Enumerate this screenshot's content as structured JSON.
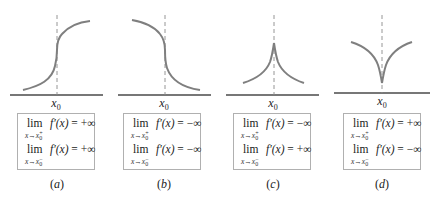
{
  "figure": {
    "colors": {
      "curve": "#7f7f7f",
      "dashed_line": "#8a8a8a",
      "axis": "#4a4a4a",
      "box_border": "#b0b0b0"
    },
    "panels": [
      {
        "id": "a",
        "caption_letter": "a",
        "x_label": "x",
        "x_label_sub": "0",
        "shape": "vertical tangent, increasing",
        "limits": [
          {
            "lim": "lim",
            "func": "f′(x)",
            "rel": "=",
            "value": "+∞",
            "var": "x",
            "arrow": "→",
            "target": "x",
            "target_sub": "0",
            "side": "+"
          },
          {
            "lim": "lim",
            "func": "f′(x)",
            "rel": "=",
            "value": "+∞",
            "var": "x",
            "arrow": "→",
            "target": "x",
            "target_sub": "0",
            "side": "−"
          }
        ]
      },
      {
        "id": "b",
        "caption_letter": "b",
        "x_label": "x",
        "x_label_sub": "0",
        "shape": "vertical tangent, decreasing",
        "limits": [
          {
            "lim": "lim",
            "func": "f′(x)",
            "rel": "=",
            "value": "−∞",
            "var": "x",
            "arrow": "→",
            "target": "x",
            "target_sub": "0",
            "side": "+"
          },
          {
            "lim": "lim",
            "func": "f′(x)",
            "rel": "=",
            "value": "−∞",
            "var": "x",
            "arrow": "→",
            "target": "x",
            "target_sub": "0",
            "side": "−"
          }
        ]
      },
      {
        "id": "c",
        "caption_letter": "c",
        "x_label": "x",
        "x_label_sub": "0",
        "shape": "cusp pointing up",
        "limits": [
          {
            "lim": "lim",
            "func": "f′(x)",
            "rel": "=",
            "value": "−∞",
            "var": "x",
            "arrow": "→",
            "target": "x",
            "target_sub": "0",
            "side": "+"
          },
          {
            "lim": "lim",
            "func": "f′(x)",
            "rel": "=",
            "value": "+∞",
            "var": "x",
            "arrow": "→",
            "target": "x",
            "target_sub": "0",
            "side": "−"
          }
        ]
      },
      {
        "id": "d",
        "caption_letter": "d",
        "x_label": "x",
        "x_label_sub": "0",
        "shape": "cusp pointing down",
        "limits": [
          {
            "lim": "lim",
            "func": "f′(x)",
            "rel": "=",
            "value": "+∞",
            "var": "x",
            "arrow": "→",
            "target": "x",
            "target_sub": "0",
            "side": "+"
          },
          {
            "lim": "lim",
            "func": "f′(x)",
            "rel": "=",
            "value": "−∞",
            "var": "x",
            "arrow": "→",
            "target": "x",
            "target_sub": "0",
            "side": "−"
          }
        ]
      }
    ]
  }
}
